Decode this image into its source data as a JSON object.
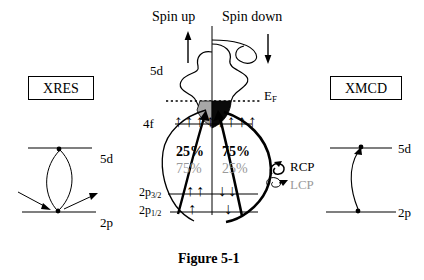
{
  "figure": {
    "caption": "Figure 5-1",
    "spin_up_label": "Spin up",
    "spin_down_label": "Spin down",
    "fermi_label": "EF",
    "fermi_label_base": "E",
    "fermi_label_sub": "F"
  },
  "left_panel": {
    "title": "XRES",
    "level_upper_label": "5d",
    "level_lower_label": "2p"
  },
  "right_panel": {
    "title": "XMCD",
    "level_upper_label": "5d",
    "level_lower_label": "2p"
  },
  "center": {
    "band_5d_label": "5d",
    "level_4f_label": "4f",
    "level_2p32_base": "2p",
    "level_2p32_sub": "3/2",
    "level_2p12_base": "2p",
    "level_2p12_sub": "1/2",
    "percent_left_black": "25%",
    "percent_right_black": "75%",
    "percent_left_gray": "75%",
    "percent_right_gray": "25%",
    "polarization_rcp": "RCP",
    "polarization_lcp": "LCP",
    "spin_up_arrow_glyph": "↑",
    "spin_down_arrow_glyph": "↓",
    "arrows_4f_left_count": 5,
    "arrows_4f_right_count": 4,
    "arrows_2p32_left_count": 2,
    "arrows_2p32_right_count": 2,
    "arrows_2p12_left_count": 1,
    "arrows_2p12_right_count": 1
  },
  "colors": {
    "ink": "#000000",
    "gray_text": "#9a9a9a",
    "spin_up_fill": "#a6a6a6",
    "spin_down_fill": "#0a0a0a",
    "background": "#ffffff"
  }
}
